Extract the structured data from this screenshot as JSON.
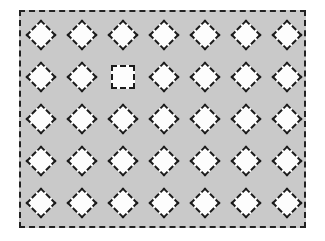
{
  "figure": {
    "background_color": "#c9c9c9",
    "shape_fill": "#fdfdfd",
    "stroke_color": "#1a1a1a",
    "rows": 5,
    "columns": 7,
    "column_centers": [
      41,
      82,
      123,
      164,
      205,
      246,
      287
    ],
    "row_centers": [
      35,
      77,
      119,
      161,
      203
    ],
    "grid": [
      [
        "diamond",
        "diamond",
        "diamond",
        "diamond",
        "diamond",
        "diamond",
        "diamond"
      ],
      [
        "diamond",
        "diamond",
        "square",
        "diamond",
        "diamond",
        "diamond",
        "diamond"
      ],
      [
        "diamond",
        "diamond",
        "diamond",
        "diamond",
        "diamond",
        "diamond",
        "diamond"
      ],
      [
        "diamond",
        "diamond",
        "diamond",
        "diamond",
        "diamond",
        "diamond",
        "diamond"
      ],
      [
        "diamond",
        "diamond",
        "diamond",
        "diamond",
        "diamond",
        "diamond",
        "diamond"
      ]
    ],
    "odd_one_out": {
      "row": 2,
      "column": 3,
      "shape": "square"
    }
  }
}
